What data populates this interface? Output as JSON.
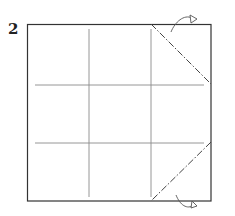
{
  "step": {
    "number": "2"
  },
  "diagram": {
    "type": "origami-fold-diagram",
    "paper": {
      "x": 27,
      "y": 24,
      "width": 184,
      "height": 177
    },
    "colors": {
      "paper_edge": "#333333",
      "crease": "#888888",
      "fold_line": "#444444"
    },
    "creases": [
      {
        "orientation": "vertical",
        "label": "valley-crease-left"
      },
      {
        "orientation": "vertical",
        "label": "valley-crease-right"
      },
      {
        "orientation": "horizontal",
        "label": "crease-upper"
      },
      {
        "orientation": "horizontal",
        "label": "crease-lower"
      }
    ],
    "fold_lines": [
      {
        "type": "mountain-fold",
        "from": "top-right-region",
        "corner": "top-right"
      },
      {
        "type": "mountain-fold",
        "from": "bottom-right-region",
        "corner": "bottom-right"
      }
    ],
    "arrows": [
      {
        "type": "fold-behind-arrow",
        "position": "top-right"
      },
      {
        "type": "fold-behind-arrow",
        "position": "bottom-right"
      }
    ]
  }
}
